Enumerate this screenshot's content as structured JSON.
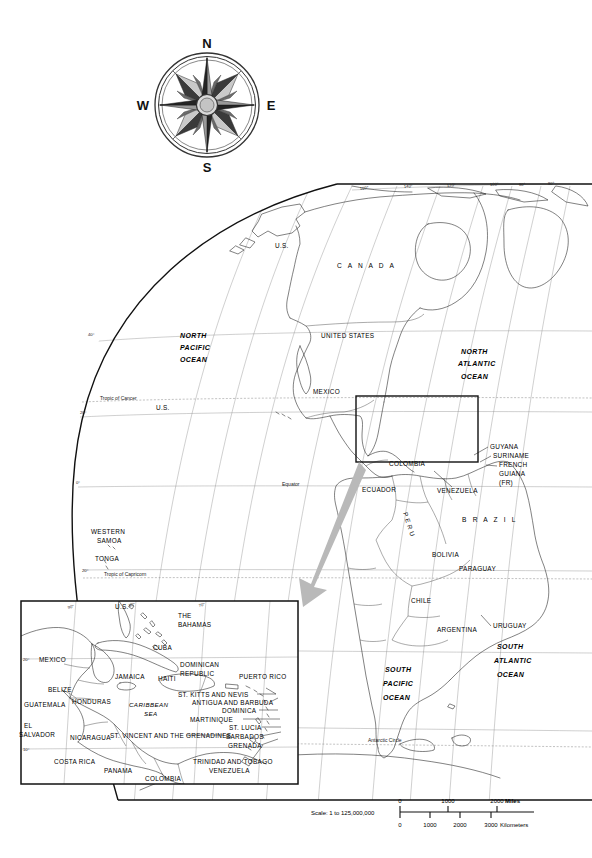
{
  "document": {
    "type": "reference-map",
    "title": "World map centered on the Americas with Caribbean inset"
  },
  "compass": {
    "name": "compass-rose",
    "north": "N",
    "east": "E",
    "south": "S",
    "west": "W"
  },
  "main_map": {
    "longitude_labels": [
      "160°",
      "140°",
      "120°",
      "100°",
      "90°",
      "80°"
    ],
    "latitude_labels": [
      "40°",
      "20°",
      "0°",
      "20°"
    ],
    "reference_lines": [
      "Tropic of Cancer",
      "Equator",
      "Tropic of Capricorn",
      "Antarctic Circle"
    ],
    "oceans": [
      "NORTH PACIFIC OCEAN",
      "NORTH ATLANTIC OCEAN",
      "SOUTH PACIFIC OCEAN",
      "SOUTH ATLANTIC OCEAN"
    ],
    "ocean_lines": {
      "north_pacific": [
        "NORTH",
        "PACIFIC",
        "OCEAN"
      ],
      "north_atlantic": [
        "NORTH",
        "ATLANTIC",
        "OCEAN"
      ],
      "south_pacific": [
        "SOUTH",
        "PACIFIC",
        "OCEAN"
      ],
      "south_atlantic": [
        "SOUTH",
        "ATLANTIC",
        "OCEAN"
      ]
    },
    "countries": [
      "CANADA",
      "UNITED  STATES",
      "MEXICO",
      "U.S.",
      "U.S.",
      "WESTERN SAMOA",
      "TONGA",
      "COLOMBIA",
      "ECUADOR",
      "VENEZUELA",
      "GUYANA",
      "SURINAME",
      "FRENCH GUIANA (FR)",
      "P E R U",
      "B R A Z I L",
      "BOLIVIA",
      "PARAGUAY",
      "CHILE",
      "ARGENTINA",
      "URUGUAY"
    ],
    "country_labels": {
      "canada": "C A N A D A",
      "united_states": "UNITED   STATES",
      "mexico": "MEXICO",
      "us_alaska": "U.S.",
      "us_hawaii": "U.S.",
      "western_samoa_1": "WESTERN",
      "western_samoa_2": "SAMOA",
      "tonga": "TONGA",
      "colombia": "COLOMBIA",
      "ecuador": "ECUADOR",
      "venezuela": "VENEZUELA",
      "guyana": "GUYANA",
      "suriname": "SURINAME",
      "french_guiana_1": "FRENCH",
      "french_guiana_2": "GUIANA",
      "french_guiana_3": "(FR)",
      "peru": "P E R U",
      "brazil": "B R A Z I L",
      "bolivia": "BOLIVIA",
      "paraguay": "PARAGUAY",
      "chile": "CHILE",
      "argentina": "ARGENTINA",
      "uruguay": "URUGUAY"
    }
  },
  "inset_map": {
    "name": "caribbean-inset",
    "longitude_labels": [
      "90°",
      "80°",
      "70°"
    ],
    "latitude_labels": [
      "20°",
      "10°"
    ],
    "labels": {
      "us": "U.S.",
      "the_bahamas_1": "THE",
      "the_bahamas_2": "BAHAMAS",
      "cuba": "CUBA",
      "mexico": "MEXICO",
      "jamaica": "JAMAICA",
      "haiti": "HAITI",
      "dominican_republic_1": "DOMINICAN",
      "dominican_republic_2": "REPUBLIC",
      "puerto_rico": "PUERTO RICO",
      "belize": "BELIZE",
      "honduras": "HONDURAS",
      "guatemala": "GUATEMALA",
      "el_salvador_1": "EL",
      "el_salvador_2": "SALVADOR",
      "nicaragua": "NICARAGUA",
      "costa_rica": "COSTA RICA",
      "panama": "PANAMA",
      "colombia": "COLOMBIA",
      "venezuela": "VENEZUELA",
      "caribbean_sea_1": "CARIBBEAN",
      "caribbean_sea_2": "SEA",
      "st_kitts_and_nevis": "ST. KITTS AND NEVIS",
      "antigua_and_barbuda": "ANTIGUA AND BARBUDA",
      "dominica": "DOMINICA",
      "martinique": "MARTINIQUE",
      "st_lucia": "ST. LUCIA",
      "st_vincent_and_the_grenadines": "ST. VINCENT AND THE GRENADINES",
      "barbados": "BARBADOS",
      "grenada": "GRENADA",
      "trinidad_and_tobago": "TRINIDAD AND TOBAGO"
    }
  },
  "scale": {
    "caption": "Scale:  1 to 125,000,000",
    "miles": {
      "unit": "Miles",
      "ticks": [
        "0",
        "1000",
        "2000"
      ]
    },
    "kilometers": {
      "unit": "Kilometers",
      "ticks": [
        "0",
        "1000",
        "2000",
        "3000"
      ]
    }
  },
  "colors": {
    "ink": "#1a1a1a",
    "graticule": "#888888",
    "arrow": "#b9b9b9",
    "paper": "#ffffff"
  }
}
